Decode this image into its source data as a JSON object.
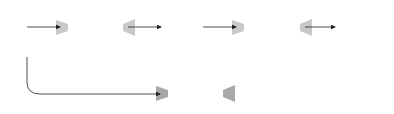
{
  "diagram": {
    "input": {
      "symbol": "x",
      "caption": "(input)"
    },
    "box_g": {
      "label": "g"
    },
    "intermediate": {
      "label": "g(x)"
    },
    "box_f": {
      "label": "f"
    },
    "output": {
      "symbol": "f(g(x))",
      "caption": "(output)"
    },
    "box_composite": {
      "label": "f ∘ g"
    }
  },
  "colors": {
    "box_light": "#dcdcdc",
    "box_dark": "#b2b2b2",
    "arrow": "#222222"
  }
}
